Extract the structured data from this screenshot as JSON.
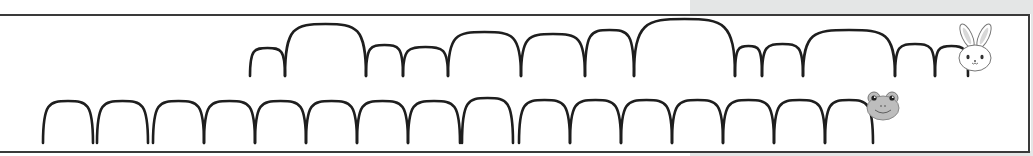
{
  "worksheet": {
    "title": "",
    "colors": {
      "line": "#1e1e1e",
      "frame": "#3a3a3a",
      "shade": "#e4e6e6",
      "frog_fill": "#bdbdbd",
      "bunny_fill": "#ffffff"
    },
    "rows": [
      {
        "name": "bunny-row",
        "character": "bunny-icon",
        "base_y": 76,
        "hops": [
          {
            "x1": 250,
            "x2": 285,
            "peak": 48
          },
          {
            "x1": 285,
            "x2": 366,
            "peak": 24
          },
          {
            "x1": 366,
            "x2": 403,
            "peak": 45
          },
          {
            "x1": 403,
            "x2": 448,
            "peak": 47
          },
          {
            "x1": 448,
            "x2": 521,
            "peak": 32
          },
          {
            "x1": 521,
            "x2": 585,
            "peak": 34
          },
          {
            "x1": 585,
            "x2": 634,
            "peak": 30
          },
          {
            "x1": 634,
            "x2": 735,
            "peak": 19
          },
          {
            "x1": 735,
            "x2": 762,
            "peak": 46
          },
          {
            "x1": 762,
            "x2": 803,
            "peak": 44
          },
          {
            "x1": 803,
            "x2": 895,
            "peak": 30
          },
          {
            "x1": 895,
            "x2": 935,
            "peak": 44
          },
          {
            "x1": 935,
            "x2": 968,
            "peak": 46
          }
        ]
      },
      {
        "name": "frog-row",
        "character": "frog-icon",
        "base_y": 143,
        "hops": [
          {
            "x1": 43,
            "x2": 93,
            "peak": 101
          },
          {
            "x1": 97,
            "x2": 148,
            "peak": 101
          },
          {
            "x1": 153,
            "x2": 204,
            "peak": 101
          },
          {
            "x1": 204,
            "x2": 255,
            "peak": 101
          },
          {
            "x1": 255,
            "x2": 306,
            "peak": 101
          },
          {
            "x1": 306,
            "x2": 357,
            "peak": 101
          },
          {
            "x1": 357,
            "x2": 408,
            "peak": 101
          },
          {
            "x1": 408,
            "x2": 460,
            "peak": 101
          },
          {
            "x1": 462,
            "x2": 513,
            "peak": 98
          },
          {
            "x1": 519,
            "x2": 570,
            "peak": 100
          },
          {
            "x1": 570,
            "x2": 621,
            "peak": 100
          },
          {
            "x1": 621,
            "x2": 672,
            "peak": 100
          },
          {
            "x1": 672,
            "x2": 723,
            "peak": 100
          },
          {
            "x1": 723,
            "x2": 774,
            "peak": 100
          },
          {
            "x1": 774,
            "x2": 825,
            "peak": 100
          },
          {
            "x1": 825,
            "x2": 873,
            "peak": 100
          }
        ]
      }
    ]
  }
}
